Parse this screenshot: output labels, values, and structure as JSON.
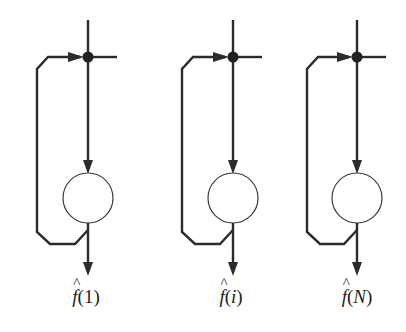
{
  "diagram": {
    "type": "feedback-accumulator-units",
    "stroke_color": "#2b2b2b",
    "units": [
      {
        "id": "unit-1",
        "x": 88,
        "label_func": "f",
        "label_open": "(",
        "label_arg": "1",
        "label_close": ")",
        "arg_italic": false
      },
      {
        "id": "unit-i",
        "x": 233,
        "label_func": "f",
        "label_open": "(",
        "label_arg": "i",
        "label_close": ")",
        "arg_italic": true
      },
      {
        "id": "unit-N",
        "x": 357,
        "label_func": "f",
        "label_open": "(",
        "label_arg": "N",
        "label_close": ")",
        "arg_italic": true
      }
    ],
    "hat_symbol": "^"
  }
}
